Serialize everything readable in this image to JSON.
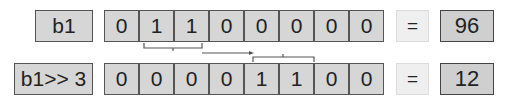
{
  "rows": [
    {
      "label": "b1",
      "bits": [
        "0",
        "1",
        "1",
        "0",
        "0",
        "0",
        "0",
        "0"
      ],
      "equals": "=",
      "result": "96"
    },
    {
      "label": "b1>> 3",
      "bits": [
        "0",
        "0",
        "0",
        "0",
        "1",
        "1",
        "0",
        "0"
      ],
      "equals": "=",
      "result": "12"
    }
  ],
  "connector": {
    "from_bits": [
      1,
      2
    ],
    "to_bits": [
      4,
      5
    ],
    "description": "shift right by 3"
  }
}
